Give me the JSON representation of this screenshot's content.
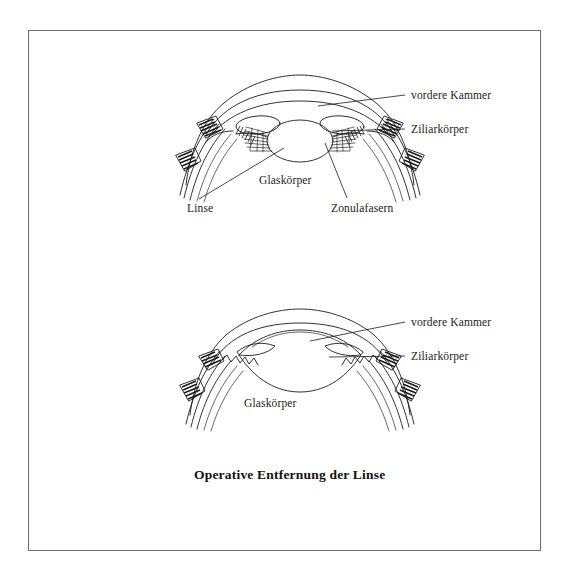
{
  "figure": {
    "caption": "Operative Entfernung der Linse",
    "border_color": "#6d6d6d",
    "ink_color": "#1b1b1b",
    "background_color": "#ffffff"
  },
  "diagrams": [
    {
      "id": "upper-eye-with-lens",
      "name": "eye-cross-section-with-lens",
      "description": "Querschnitt des Auges mit Linse",
      "labels": [
        {
          "id": "vordere-kammer-upper",
          "text": "vordere Kammer",
          "x": 411,
          "y": 89,
          "leader_from": [
            405,
            95
          ],
          "leader_to": [
            318,
            106
          ]
        },
        {
          "id": "ziliarkoerper-upper",
          "text": "Ziliarkörper",
          "x": 411,
          "y": 123,
          "leader_from": [
            405,
            129
          ],
          "leader_to": [
            332,
            131
          ]
        },
        {
          "id": "glaskoerper-upper",
          "text": "Glaskörper",
          "x": 259,
          "y": 174,
          "leader_from": null,
          "leader_to": null
        },
        {
          "id": "linse-upper",
          "text": "Linse",
          "x": 187,
          "y": 202,
          "leader_from": [
            199,
            199
          ],
          "leader_to": [
            284,
            148
          ]
        },
        {
          "id": "zonulafasern-upper",
          "text": "Zonulafasern",
          "x": 331,
          "y": 202,
          "leader_from": [
            347,
            198
          ],
          "leader_to": [
            325,
            143
          ]
        }
      ]
    },
    {
      "id": "lower-eye-without-lens",
      "name": "eye-cross-section-after-lens-removal",
      "description": "Querschnitt des Auges nach operativer Entfernung der Linse",
      "labels": [
        {
          "id": "vordere-kammer-lower",
          "text": "vordere Kammer",
          "x": 411,
          "y": 316,
          "leader_from": [
            405,
            322
          ],
          "leader_to": [
            310,
            341
          ]
        },
        {
          "id": "ziliarkoerper-lower",
          "text": "Ziliarkörper",
          "x": 411,
          "y": 350,
          "leader_from": [
            405,
            356
          ],
          "leader_to": [
            329,
            357
          ]
        },
        {
          "id": "glaskoerper-lower",
          "text": "Glaskörper",
          "x": 244,
          "y": 397,
          "leader_from": null,
          "leader_to": null
        }
      ]
    }
  ]
}
